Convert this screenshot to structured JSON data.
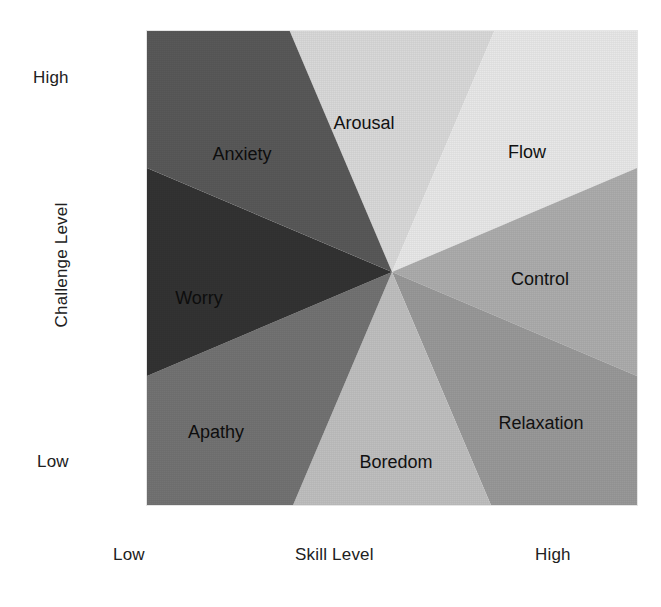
{
  "figure": {
    "background_color": "#ffffff",
    "frame": {
      "x": 147,
      "y": 31,
      "width": 490,
      "height": 474
    },
    "center": {
      "x": 392,
      "y": 272
    }
  },
  "axes": {
    "y": {
      "title": "Challenge Level",
      "high_label": "High",
      "low_label": "Low"
    },
    "x": {
      "title": "Skill Level",
      "low_label": "Low",
      "high_label": "High"
    }
  },
  "chart_data": {
    "type": "pie",
    "xlabel": "Skill Level",
    "ylabel": "Challenge Level",
    "xtick_labels": [
      "Low",
      "High"
    ],
    "ytick_labels": [
      "Low",
      "High"
    ],
    "grid": false,
    "legend": "none",
    "center": {
      "x": 392,
      "y": 272
    },
    "categories": [
      "Arousal",
      "Flow",
      "Control",
      "Relaxation",
      "Boredom",
      "Apathy",
      "Worry",
      "Anxiety"
    ],
    "values": [
      46,
      44,
      46,
      44,
      46,
      44,
      46,
      44
    ],
    "colors": [
      "#d9d9d9",
      "#e8e8e8",
      "#adadad",
      "#999999",
      "#bfbfbf",
      "#737373",
      "#333333",
      "#595959"
    ],
    "sectors": [
      {
        "label": "Arousal",
        "color": "#d9d9d9",
        "start_angle_deg": 67,
        "end_angle_deg": 113,
        "quadrant": "high challenge / medium skill",
        "label_pos": {
          "x": 364,
          "y": 124
        }
      },
      {
        "label": "Flow",
        "color": "#e8e8e8",
        "start_angle_deg": 23,
        "end_angle_deg": 67,
        "quadrant": "high challenge / high skill",
        "label_pos": {
          "x": 527,
          "y": 153
        }
      },
      {
        "label": "Control",
        "color": "#adadad",
        "start_angle_deg": -23,
        "end_angle_deg": 23,
        "quadrant": "medium challenge / high skill",
        "label_pos": {
          "x": 540,
          "y": 280
        }
      },
      {
        "label": "Relaxation",
        "color": "#999999",
        "start_angle_deg": -67,
        "end_angle_deg": -23,
        "quadrant": "low challenge / high skill",
        "label_pos": {
          "x": 541,
          "y": 424
        }
      },
      {
        "label": "Boredom",
        "color": "#bfbfbf",
        "start_angle_deg": -113,
        "end_angle_deg": -67,
        "quadrant": "low challenge / medium skill",
        "label_pos": {
          "x": 396,
          "y": 463
        }
      },
      {
        "label": "Apathy",
        "color": "#737373",
        "start_angle_deg": -157,
        "end_angle_deg": -113,
        "quadrant": "low challenge / low skill",
        "label_pos": {
          "x": 216,
          "y": 433
        }
      },
      {
        "label": "Worry",
        "color": "#333333",
        "start_angle_deg": 157,
        "end_angle_deg": 203,
        "quadrant": "medium challenge / low skill",
        "label_pos": {
          "x": 199,
          "y": 299
        }
      },
      {
        "label": "Anxiety",
        "color": "#595959",
        "start_angle_deg": 113,
        "end_angle_deg": 157,
        "quadrant": "high challenge / low skill",
        "label_pos": {
          "x": 242,
          "y": 155
        }
      }
    ]
  }
}
